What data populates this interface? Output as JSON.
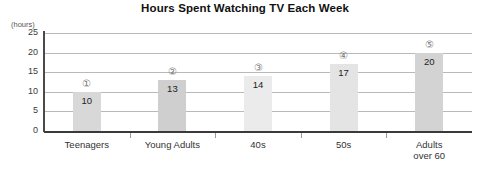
{
  "chart_data": {
    "type": "bar",
    "title": "Hours Spent Watching TV Each Week",
    "xlabel": "",
    "ylabel": "(hours)",
    "ylim": [
      0,
      25
    ],
    "yticks": [
      "0",
      "5",
      "10",
      "15",
      "20",
      "25"
    ],
    "grid": true,
    "legend": "none",
    "categories": [
      "Teenagers",
      "Young Adults",
      "40s",
      "50s",
      "Adults over 60"
    ],
    "category_lines": [
      [
        "Teenagers"
      ],
      [
        "Young Adults"
      ],
      [
        "40s"
      ],
      [
        "50s"
      ],
      [
        "Adults",
        "over 60"
      ]
    ],
    "values": [
      10,
      13,
      14,
      17,
      20
    ],
    "value_labels": [
      "10",
      "13",
      "14",
      "17",
      "20"
    ],
    "markers": [
      "①",
      "②",
      "③",
      "④",
      "⑤"
    ],
    "bar_colors": [
      "#d8d8d8",
      "#cfcfcf",
      "#ebebeb",
      "#e4e4e4",
      "#d3d3d3"
    ],
    "grid_color": "#b9b9b9",
    "axis_color": "#3a3a3a",
    "background": "#ffffff"
  }
}
